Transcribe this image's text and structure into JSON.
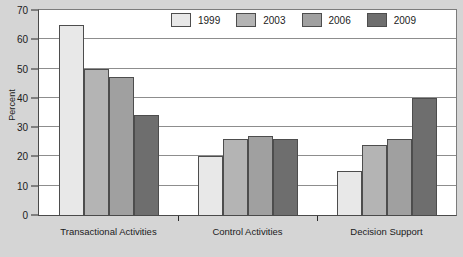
{
  "chart_data": {
    "type": "bar",
    "title": "",
    "xlabel": "",
    "ylabel": "Percent",
    "ylim": [
      0,
      70
    ],
    "ytick_step": 10,
    "yticks": [
      0,
      10,
      20,
      30,
      40,
      50,
      60,
      70
    ],
    "grid": true,
    "legend_position": "top-right-inside",
    "categories": [
      "Transactional Activities",
      "Control Activities",
      "Decision Support"
    ],
    "series": [
      {
        "name": "1999",
        "color": "#e8e8e8",
        "values": [
          65,
          20,
          15
        ]
      },
      {
        "name": "2003",
        "color": "#b4b4b4",
        "values": [
          50,
          26,
          24
        ]
      },
      {
        "name": "2006",
        "color": "#a0a0a0",
        "values": [
          47,
          27,
          26
        ]
      },
      {
        "name": "2009",
        "color": "#6e6e6e",
        "values": [
          34,
          26,
          40
        ]
      }
    ]
  },
  "axis": {
    "y_title": "Percent",
    "y_labels": [
      "70",
      "60",
      "50",
      "40",
      "30",
      "20",
      "10",
      "0"
    ],
    "x_labels": [
      "Transactional Activities",
      "Control Activities",
      "Decision Support"
    ]
  },
  "legend": {
    "items": [
      {
        "label": "1999",
        "color": "#e8e8e8"
      },
      {
        "label": "2003",
        "color": "#b4b4b4"
      },
      {
        "label": "2006",
        "color": "#a0a0a0"
      },
      {
        "label": "2009",
        "color": "#6e6e6e"
      }
    ]
  },
  "colors": {
    "background": "#d5d5d5",
    "plot_background": "#ffffff",
    "gridline": "#8d8d8d",
    "axis": "#2a2a2a",
    "bar_border": "#4d4d4d",
    "text": "#1b1b1b"
  }
}
